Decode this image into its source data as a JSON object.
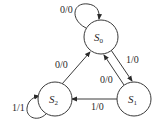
{
  "diagram": {
    "type": "state-machine",
    "states": [
      {
        "id": "S0",
        "name": "S",
        "sub": "0"
      },
      {
        "id": "S1",
        "name": "S",
        "sub": "1"
      },
      {
        "id": "S2",
        "name": "S",
        "sub": "2"
      }
    ],
    "transitions": [
      {
        "from": "S0",
        "to": "S0",
        "label": "0/0"
      },
      {
        "from": "S0",
        "to": "S1",
        "label": "1/0"
      },
      {
        "from": "S1",
        "to": "S0",
        "label": "0/0"
      },
      {
        "from": "S1",
        "to": "S2",
        "label": "1/0"
      },
      {
        "from": "S2",
        "to": "S0",
        "label": "0/0"
      },
      {
        "from": "S2",
        "to": "S2",
        "label": "1/1"
      }
    ]
  }
}
